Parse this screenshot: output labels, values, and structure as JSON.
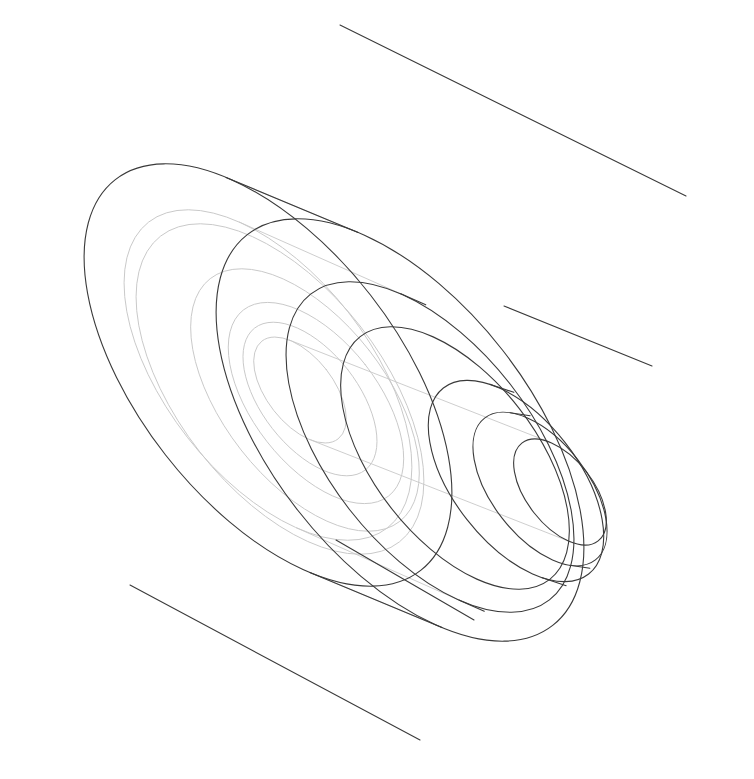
{
  "document": {
    "title": "Stepped Cylindrical Hub — Isometric Wireframe",
    "background_color": "#ffffff",
    "canvas_width": 754,
    "canvas_height": 779
  },
  "style": {
    "visible_edge_color": "#3a3a3a",
    "hidden_edge_color": "#c8c8c8",
    "visible_edge_width": 1.1,
    "hidden_edge_width": 0.9
  },
  "view": {
    "projection": "isometric",
    "axis_direction_deg": -38,
    "ellipse_rotation_deg": -38,
    "ellipse_aspect_ratio": 0.52
  },
  "geometry": {
    "description": "Five concentric coaxial cylindrical steps plus a through bore, drawn as rotated ellipses along a common axis running from the large back flange at upper-left to the small front boss at lower-right.",
    "axis_start": {
      "x": 268,
      "y": 375
    },
    "axis_end": {
      "x": 560,
      "y": 492
    },
    "rings": [
      {
        "name": "back-flange-outer",
        "kind": "visible",
        "center": {
          "x": 268,
          "y": 375
        },
        "rx": 250,
        "ry": 248,
        "rotation_deg": -38,
        "squash": 1.0
      },
      {
        "name": "back-flange-outer-front",
        "kind": "visible",
        "center": {
          "x": 400,
          "y": 430
        },
        "rx": 250,
        "ry": 248,
        "rotation_deg": -38,
        "squash": 1.0
      },
      {
        "name": "back-flange-bore",
        "kind": "hidden",
        "center": {
          "x": 268,
          "y": 375
        },
        "rx": 196,
        "ry": 194,
        "rotation_deg": -38,
        "squash": 1.0
      },
      {
        "name": "step-2-outer",
        "kind": "visible",
        "center": {
          "x": 430,
          "y": 447
        },
        "rx": 196,
        "ry": 194,
        "rotation_deg": -38,
        "squash": 1.0
      },
      {
        "name": "step-3-outer",
        "kind": "visible",
        "center": {
          "x": 455,
          "y": 458
        },
        "rx": 156,
        "ry": 154,
        "rotation_deg": -38,
        "squash": 1.0
      },
      {
        "name": "step-4-outer",
        "kind": "visible",
        "center": {
          "x": 516,
          "y": 481
        },
        "rx": 120,
        "ry": 118,
        "rotation_deg": -38,
        "squash": 1.0
      },
      {
        "name": "front-boss-outer",
        "kind": "visible",
        "center": {
          "x": 540,
          "y": 489
        },
        "rx": 92,
        "ry": 90,
        "rotation_deg": -38,
        "squash": 1.0
      },
      {
        "name": "through-bore-front",
        "kind": "visible",
        "center": {
          "x": 560,
          "y": 492
        },
        "rx": 64,
        "ry": 62,
        "rotation_deg": -38,
        "squash": 1.0
      },
      {
        "name": "through-bore-back",
        "kind": "hidden",
        "center": {
          "x": 300,
          "y": 390
        },
        "rx": 64,
        "ry": 62,
        "rotation_deg": -38,
        "squash": 1.0
      }
    ],
    "silhouette_lines": [
      {
        "name": "top-silhouette",
        "from": {
          "x": 340,
          "y": 25
        },
        "to": {
          "x": 686,
          "y": 196
        }
      },
      {
        "name": "bottom-silhouette",
        "from": {
          "x": 130,
          "y": 585
        },
        "to": {
          "x": 420,
          "y": 740
        }
      },
      {
        "name": "step-tangent-upper",
        "from": {
          "x": 504,
          "y": 306
        },
        "to": {
          "x": 652,
          "y": 366
        }
      },
      {
        "name": "step-tangent-lower",
        "from": {
          "x": 336,
          "y": 540
        },
        "to": {
          "x": 474,
          "y": 620
        }
      }
    ]
  },
  "labels": {
    "none_visible": ""
  }
}
